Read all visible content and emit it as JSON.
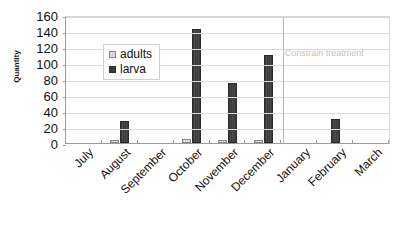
{
  "chart_data": {
    "type": "bar",
    "title": "",
    "xlabel": "",
    "ylabel": "Quantity",
    "ylim": [
      0,
      160
    ],
    "ytick_step": 20,
    "yticks": [
      0,
      20,
      40,
      60,
      80,
      100,
      120,
      140,
      160
    ],
    "grid": true,
    "legend_position": "inside-upper-left",
    "categories": [
      "July",
      "August",
      "September",
      "October",
      "November",
      "December",
      "January",
      "February",
      "March"
    ],
    "series": [
      {
        "name": "adults",
        "color": "#d2d2d2",
        "values": [
          0,
          4,
          0,
          5,
          4,
          4,
          0,
          0,
          0
        ]
      },
      {
        "name": "larva",
        "color": "#3a3a3a",
        "values": [
          0,
          27,
          0,
          143,
          75,
          110,
          0,
          30,
          0
        ]
      }
    ],
    "annotations": [
      {
        "text": "Constrain treatment",
        "color": "#c2c2c2",
        "after_category": "December"
      }
    ],
    "divider_after_category": "December"
  }
}
